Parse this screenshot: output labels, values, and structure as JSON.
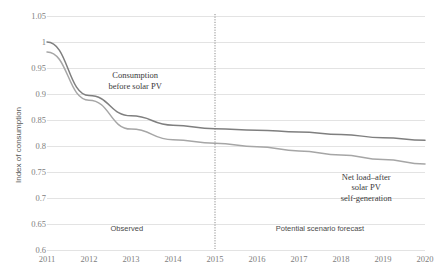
{
  "chart_data": {
    "type": "line",
    "title": "",
    "xlabel": "",
    "ylabel": "Index of consumption",
    "x": [
      2011,
      2012,
      2013,
      2014,
      2015,
      2016,
      2017,
      2018,
      2019,
      2020
    ],
    "categories": [
      "2011",
      "2012",
      "2013",
      "2014",
      "2015",
      "2016",
      "2017",
      "2018",
      "2019",
      "2020"
    ],
    "ylim": [
      0.6,
      1.05
    ],
    "yticks": [
      0.6,
      0.65,
      0.7,
      0.75,
      0.8,
      0.85,
      0.9,
      0.95,
      1,
      1.05
    ],
    "ytick_labels": [
      "0.6",
      "0.65",
      "0.7",
      "0.75",
      "0.8",
      "0.85",
      "0.9",
      "0.95",
      "1",
      "1.05"
    ],
    "grid": true,
    "legend": "none",
    "series": [
      {
        "name": "Consumption before solar PV",
        "color": "#7f7f7f",
        "values": [
          1.0,
          0.897,
          0.858,
          0.84,
          0.833,
          0.8305,
          0.827,
          0.822,
          0.816,
          0.811
        ]
      },
      {
        "name": "Net load–after solar PV self-generation",
        "color": "#a6a6a6",
        "values": [
          0.981,
          0.888,
          0.8325,
          0.812,
          0.8055,
          0.7985,
          0.7905,
          0.7825,
          0.774,
          0.7655
        ]
      }
    ],
    "annotations": [
      {
        "id": "annot-consumption",
        "text": "Consumption\nbefore solar PV",
        "x": 2013.1,
        "y": 0.928
      },
      {
        "id": "annot-netload",
        "text": "Net load–after solar PV\nself-generation",
        "x": 2018.6,
        "y": 0.733
      }
    ],
    "divider": {
      "x": 2015,
      "style": "dotted",
      "color": "#808080"
    },
    "region_labels": [
      {
        "id": "region-observed",
        "text": "Observed",
        "x": 2012.9
      },
      {
        "id": "region-forecast",
        "text": "Potential scenario forecast",
        "x": 2017.5
      }
    ]
  }
}
